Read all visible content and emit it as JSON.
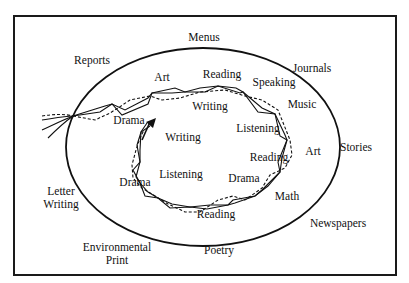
{
  "diagram": {
    "type": "concept-diagram",
    "outer_labels": [
      {
        "id": "menus",
        "text": "Menus",
        "x": 204,
        "y": 37
      },
      {
        "id": "reports",
        "text": "Reports",
        "x": 92,
        "y": 60
      },
      {
        "id": "journals",
        "text": "Journals",
        "x": 312,
        "y": 68
      },
      {
        "id": "stories",
        "text": "Stories",
        "x": 356,
        "y": 147
      },
      {
        "id": "letter-writing",
        "text": "Letter\nWriting",
        "line1": "Letter",
        "line2": "Writing",
        "x": 61,
        "y": 198
      },
      {
        "id": "newspapers",
        "text": "Newspapers",
        "x": 338,
        "y": 223
      },
      {
        "id": "environmental-print",
        "text": "Environmental\nPrint",
        "line1": "Environmental",
        "line2": "Print",
        "x": 117,
        "y": 254
      },
      {
        "id": "poetry",
        "text": "Poetry",
        "x": 219,
        "y": 250
      }
    ],
    "inner_labels": [
      {
        "id": "art-top",
        "text": "Art",
        "x": 162,
        "y": 77
      },
      {
        "id": "reading-top",
        "text": "Reading",
        "x": 222,
        "y": 74
      },
      {
        "id": "speaking",
        "text": "Speaking",
        "x": 274,
        "y": 82
      },
      {
        "id": "writing-top",
        "text": "Writing",
        "x": 210,
        "y": 106
      },
      {
        "id": "music",
        "text": "Music",
        "x": 302,
        "y": 104
      },
      {
        "id": "drama-left",
        "text": "Drama",
        "x": 129,
        "y": 120
      },
      {
        "id": "writing-inner",
        "text": "Writing",
        "x": 183,
        "y": 137
      },
      {
        "id": "listening-right",
        "text": "Listening",
        "x": 258,
        "y": 128
      },
      {
        "id": "art-right",
        "text": "Art",
        "x": 313,
        "y": 151
      },
      {
        "id": "reading-right",
        "text": "Reading",
        "x": 269,
        "y": 157
      },
      {
        "id": "listening-bottom",
        "text": "Listening",
        "x": 181,
        "y": 174
      },
      {
        "id": "drama-bottom-left",
        "text": "Drama",
        "x": 135,
        "y": 182
      },
      {
        "id": "drama-bottom-right",
        "text": "Drama",
        "x": 244,
        "y": 178
      },
      {
        "id": "math",
        "text": "Math",
        "x": 287,
        "y": 196
      },
      {
        "id": "reading-bottom",
        "text": "Reading",
        "x": 216,
        "y": 214
      }
    ],
    "colors": {
      "ink": "#111111",
      "background": "#ffffff"
    }
  }
}
